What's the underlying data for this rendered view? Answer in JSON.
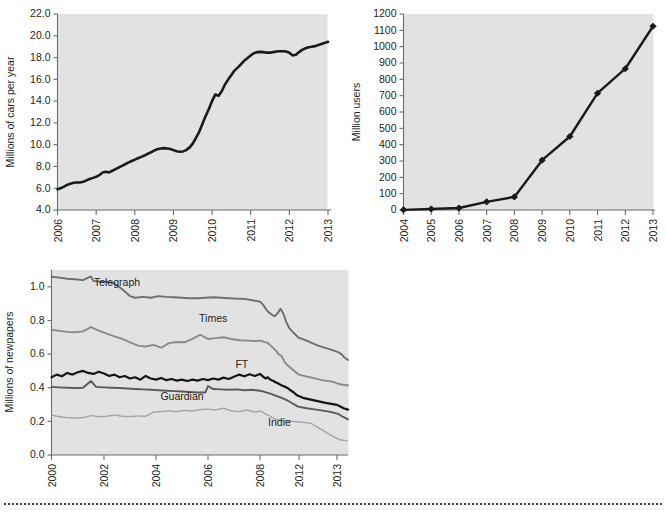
{
  "page": {
    "background_color": "#ffffff",
    "plot_background_color": "#e2e2e2",
    "axis_color": "#6b6b6b",
    "text_color": "#231f20",
    "footer_rule": "dotted-separator"
  },
  "chart_data": [
    {
      "id": "cars-chart",
      "type": "line",
      "title": "",
      "xlabel": "",
      "ylabel": "Millions of cars per year",
      "xlim": [
        2006,
        2013
      ],
      "ylim": [
        4.0,
        22.0
      ],
      "grid": false,
      "legend": "none",
      "ytick_labels": [
        "4.0",
        "6.0",
        "8.0",
        "10.0",
        "12.0",
        "14.0",
        "16.0",
        "18.0",
        "20.0",
        "22.0"
      ],
      "ytick_values": [
        4.0,
        6.0,
        8.0,
        10.0,
        12.0,
        14.0,
        16.0,
        18.0,
        20.0,
        22.0
      ],
      "xtick_labels": [
        "2006",
        "2007",
        "2008",
        "2009",
        "2010",
        "2011",
        "2012",
        "2013"
      ],
      "xtick_values": [
        2006,
        2007,
        2008,
        2009,
        2010,
        2011,
        2012,
        2013
      ],
      "line_color": "#1a1a1a",
      "series": [
        {
          "name": "Millions of cars per year",
          "x": [
            2006.0,
            2006.08,
            2006.17,
            2006.25,
            2006.33,
            2006.42,
            2006.5,
            2006.58,
            2006.67,
            2006.75,
            2006.83,
            2006.92,
            2007.0,
            2007.08,
            2007.17,
            2007.25,
            2007.33,
            2007.42,
            2007.5,
            2007.58,
            2007.67,
            2007.75,
            2007.83,
            2007.92,
            2008.0,
            2008.08,
            2008.17,
            2008.25,
            2008.33,
            2008.42,
            2008.5,
            2008.58,
            2008.67,
            2008.75,
            2008.83,
            2008.92,
            2009.0,
            2009.08,
            2009.17,
            2009.25,
            2009.33,
            2009.42,
            2009.5,
            2009.58,
            2009.67,
            2009.75,
            2009.83,
            2009.92,
            2010.0,
            2010.08,
            2010.17,
            2010.25,
            2010.33,
            2010.42,
            2010.5,
            2010.58,
            2010.67,
            2010.75,
            2010.83,
            2010.92,
            2011.0,
            2011.08,
            2011.17,
            2011.25,
            2011.33,
            2011.42,
            2011.5,
            2011.58,
            2011.67,
            2011.75,
            2011.83,
            2011.92,
            2012.0,
            2012.08,
            2012.17,
            2012.25,
            2012.33,
            2012.42,
            2012.5,
            2012.58,
            2012.67,
            2012.75,
            2012.83,
            2012.92,
            2013.0
          ],
          "y": [
            5.9,
            6.0,
            6.15,
            6.3,
            6.42,
            6.5,
            6.52,
            6.53,
            6.6,
            6.72,
            6.85,
            6.95,
            7.05,
            7.2,
            7.45,
            7.52,
            7.45,
            7.6,
            7.75,
            7.9,
            8.05,
            8.2,
            8.35,
            8.5,
            8.62,
            8.75,
            8.88,
            9.0,
            9.15,
            9.3,
            9.45,
            9.58,
            9.65,
            9.68,
            9.65,
            9.6,
            9.5,
            9.4,
            9.35,
            9.38,
            9.5,
            9.75,
            10.1,
            10.6,
            11.2,
            11.9,
            12.6,
            13.3,
            14.0,
            14.6,
            14.5,
            14.9,
            15.5,
            16.0,
            16.4,
            16.8,
            17.1,
            17.4,
            17.7,
            17.95,
            18.2,
            18.4,
            18.5,
            18.52,
            18.5,
            18.45,
            18.45,
            18.5,
            18.55,
            18.58,
            18.58,
            18.55,
            18.45,
            18.2,
            18.25,
            18.5,
            18.7,
            18.85,
            18.95,
            19.0,
            19.05,
            19.15,
            19.25,
            19.35,
            19.45
          ]
        }
      ]
    },
    {
      "id": "users-chart",
      "type": "line",
      "title": "",
      "xlabel": "",
      "ylabel": "Million users",
      "xlim": [
        2004,
        2013
      ],
      "ylim": [
        0,
        1200
      ],
      "grid": false,
      "legend": "none",
      "markers": "diamond",
      "ytick_labels": [
        "0",
        "100",
        "200",
        "300",
        "400",
        "500",
        "600",
        "700",
        "800",
        "900",
        "1000",
        "1100",
        "1200"
      ],
      "ytick_values": [
        0,
        100,
        200,
        300,
        400,
        500,
        600,
        700,
        800,
        900,
        1000,
        1100,
        1200
      ],
      "xtick_labels": [
        "2004",
        "2005",
        "2006",
        "2007",
        "2008",
        "2009",
        "2010",
        "2011",
        "2012",
        "2013"
      ],
      "xtick_values": [
        2004,
        2005,
        2006,
        2007,
        2008,
        2009,
        2010,
        2011,
        2012,
        2013
      ],
      "line_color": "#1a1a1a",
      "series": [
        {
          "name": "Million users",
          "x": [
            2004,
            2005,
            2006,
            2007,
            2008,
            2009,
            2010,
            2011,
            2012,
            2013
          ],
          "y": [
            1,
            6,
            12,
            50,
            80,
            305,
            450,
            715,
            865,
            1125
          ]
        }
      ]
    },
    {
      "id": "newspapers-chart",
      "type": "line",
      "title": "",
      "xlabel": "",
      "ylabel": "Millions of newpapers",
      "xlim": [
        2000,
        2014
      ],
      "ylim": [
        0.0,
        1.1
      ],
      "grid": false,
      "legend": "inline-labels",
      "ytick_labels": [
        "0.0",
        "0.2",
        "0.4",
        "0.6",
        "0.8",
        "1.0"
      ],
      "ytick_values": [
        0.0,
        0.2,
        0.4,
        0.6,
        0.8,
        1.0
      ],
      "xtick_labels": [
        "2000",
        "2002",
        "2004",
        "2006",
        "2008",
        "2012",
        "2013"
      ],
      "xtick_values": [
        2000,
        2002,
        2004,
        2006,
        2008,
        2012,
        2013
      ],
      "series": [
        {
          "name": "Telegraph",
          "color": "#6e6e6e",
          "label_x": 2002.5,
          "label_y": 1.005,
          "x": [
            2000.0,
            2000.3,
            2000.6,
            2000.9,
            2001.2,
            2001.5,
            2001.6,
            2001.8,
            2002.1,
            2002.4,
            2002.7,
            2003.0,
            2003.2,
            2003.5,
            2003.8,
            2004.1,
            2004.4,
            2004.7,
            2005.0,
            2005.3,
            2005.6,
            2005.9,
            2006.2,
            2006.5,
            2006.8,
            2007.1,
            2007.4,
            2007.7,
            2008.0,
            2008.3,
            2008.6,
            2008.9,
            2009.2,
            2009.5,
            2009.8,
            2010.1,
            2010.4,
            2010.7,
            2011.0,
            2011.3,
            2011.6,
            2011.9,
            2012.2,
            2012.5,
            2012.8,
            2013.1,
            2013.4,
            2013.7,
            2014.0
          ],
          "y": [
            1.06,
            1.055,
            1.048,
            1.045,
            1.04,
            1.062,
            1.035,
            1.032,
            1.03,
            1.02,
            0.985,
            0.945,
            0.935,
            0.94,
            0.935,
            0.945,
            0.94,
            0.938,
            0.935,
            0.932,
            0.932,
            0.935,
            0.938,
            0.935,
            0.932,
            0.93,
            0.928,
            0.92,
            0.912,
            0.895,
            0.868,
            0.848,
            0.835,
            0.825,
            0.842,
            0.87,
            0.84,
            0.79,
            0.755,
            0.735,
            0.718,
            0.7,
            0.68,
            0.65,
            0.63,
            0.612,
            0.6,
            0.578,
            0.565
          ]
        },
        {
          "name": "Times",
          "color": "#8a8a8a",
          "label_x": 2006.2,
          "label_y": 0.79,
          "x": [
            2000.0,
            2000.3,
            2000.6,
            2000.9,
            2001.2,
            2001.5,
            2001.8,
            2002.1,
            2002.4,
            2002.7,
            2003.0,
            2003.3,
            2003.6,
            2003.9,
            2004.2,
            2004.5,
            2004.8,
            2005.1,
            2005.4,
            2005.7,
            2006.0,
            2006.3,
            2006.6,
            2006.9,
            2007.2,
            2007.5,
            2007.8,
            2008.1,
            2008.4,
            2008.7,
            2009.0,
            2009.3,
            2009.6,
            2009.9,
            2010.2,
            2010.5,
            2010.8,
            2011.1,
            2011.4,
            2011.7,
            2012.0,
            2012.3,
            2012.6,
            2012.9,
            2013.2,
            2013.5,
            2013.8,
            2014.0
          ],
          "y": [
            0.745,
            0.738,
            0.732,
            0.73,
            0.735,
            0.76,
            0.74,
            0.722,
            0.705,
            0.69,
            0.67,
            0.65,
            0.645,
            0.655,
            0.638,
            0.665,
            0.672,
            0.67,
            0.69,
            0.715,
            0.69,
            0.695,
            0.7,
            0.69,
            0.682,
            0.68,
            0.678,
            0.68,
            0.672,
            0.67,
            0.655,
            0.64,
            0.622,
            0.6,
            0.59,
            0.555,
            0.535,
            0.52,
            0.505,
            0.49,
            0.478,
            0.462,
            0.445,
            0.435,
            0.422,
            0.418,
            0.415,
            0.415
          ]
        },
        {
          "name": "FT",
          "color": "#151515",
          "label_x": 2007.3,
          "label_y": 0.52,
          "x": [
            2000.0,
            2000.2,
            2000.4,
            2000.6,
            2000.8,
            2001.0,
            2001.2,
            2001.4,
            2001.6,
            2001.8,
            2002.0,
            2002.2,
            2002.4,
            2002.6,
            2002.8,
            2003.0,
            2003.2,
            2003.4,
            2003.6,
            2003.8,
            2004.0,
            2004.2,
            2004.4,
            2004.6,
            2004.8,
            2005.0,
            2005.2,
            2005.4,
            2005.6,
            2005.8,
            2006.0,
            2006.2,
            2006.4,
            2006.6,
            2006.8,
            2007.0,
            2007.2,
            2007.4,
            2007.6,
            2007.8,
            2008.0,
            2008.2,
            2008.4,
            2008.6,
            2008.8,
            2009.0,
            2009.2,
            2009.4,
            2009.6,
            2009.8,
            2010.0,
            2010.3,
            2010.6,
            2010.9,
            2011.2,
            2011.5,
            2011.8,
            2012.1,
            2012.4,
            2012.7,
            2013.0,
            2013.3,
            2013.6,
            2014.0
          ],
          "y": [
            0.462,
            0.478,
            0.468,
            0.488,
            0.478,
            0.492,
            0.5,
            0.488,
            0.482,
            0.495,
            0.485,
            0.47,
            0.478,
            0.462,
            0.47,
            0.455,
            0.462,
            0.448,
            0.47,
            0.455,
            0.448,
            0.458,
            0.445,
            0.452,
            0.442,
            0.448,
            0.44,
            0.448,
            0.442,
            0.452,
            0.445,
            0.455,
            0.448,
            0.46,
            0.452,
            0.465,
            0.478,
            0.468,
            0.48,
            0.47,
            0.482,
            0.472,
            0.462,
            0.455,
            0.462,
            0.45,
            0.445,
            0.44,
            0.432,
            0.428,
            0.42,
            0.412,
            0.405,
            0.395,
            0.382,
            0.37,
            0.355,
            0.34,
            0.325,
            0.31,
            0.298,
            0.288,
            0.278,
            0.27
          ]
        },
        {
          "name": "Guardian",
          "color": "#5a5a5a",
          "label_x": 2005.0,
          "label_y": 0.33,
          "x": [
            2000.0,
            2000.3,
            2000.6,
            2000.9,
            2001.2,
            2001.5,
            2001.7,
            2002.0,
            2002.3,
            2002.6,
            2002.9,
            2003.2,
            2003.5,
            2003.8,
            2004.1,
            2004.4,
            2004.7,
            2005.0,
            2005.3,
            2005.6,
            2005.9,
            2006.0,
            2006.2,
            2006.5,
            2006.8,
            2007.1,
            2007.4,
            2007.7,
            2008.0,
            2008.3,
            2008.6,
            2008.9,
            2009.2,
            2009.5,
            2009.8,
            2010.1,
            2010.4,
            2010.7,
            2011.0,
            2011.3,
            2011.6,
            2011.9,
            2012.2,
            2012.5,
            2012.8,
            2013.1,
            2013.4,
            2013.7,
            2014.0
          ],
          "y": [
            0.405,
            0.402,
            0.4,
            0.398,
            0.4,
            0.44,
            0.405,
            0.402,
            0.4,
            0.398,
            0.395,
            0.392,
            0.39,
            0.388,
            0.385,
            0.382,
            0.38,
            0.378,
            0.375,
            0.372,
            0.372,
            0.41,
            0.392,
            0.39,
            0.388,
            0.39,
            0.385,
            0.388,
            0.382,
            0.378,
            0.372,
            0.368,
            0.362,
            0.355,
            0.348,
            0.342,
            0.335,
            0.328,
            0.318,
            0.308,
            0.298,
            0.288,
            0.278,
            0.268,
            0.258,
            0.245,
            0.232,
            0.222,
            0.212
          ]
        },
        {
          "name": "Indie",
          "color": "#9e9e9e",
          "style": "dotted",
          "label_x": 2010.0,
          "label_y": 0.175,
          "x": [
            2000.0,
            2000.3,
            2000.6,
            2000.9,
            2001.2,
            2001.5,
            2001.8,
            2002.1,
            2002.4,
            2002.7,
            2003.0,
            2003.3,
            2003.6,
            2003.9,
            2004.2,
            2004.5,
            2004.8,
            2005.1,
            2005.4,
            2005.7,
            2006.0,
            2006.3,
            2006.6,
            2006.9,
            2007.2,
            2007.5,
            2007.8,
            2008.1,
            2008.4,
            2008.7,
            2009.0,
            2009.3,
            2009.6,
            2009.9,
            2010.2,
            2010.5,
            2010.8,
            2011.1,
            2011.4,
            2011.7,
            2012.0,
            2012.3,
            2012.6,
            2012.9,
            2013.2,
            2013.5,
            2013.8,
            2014.0
          ],
          "y": [
            0.238,
            0.228,
            0.222,
            0.22,
            0.222,
            0.235,
            0.228,
            0.23,
            0.238,
            0.23,
            0.228,
            0.232,
            0.23,
            0.255,
            0.258,
            0.262,
            0.258,
            0.265,
            0.262,
            0.27,
            0.272,
            0.268,
            0.278,
            0.262,
            0.258,
            0.268,
            0.255,
            0.262,
            0.25,
            0.24,
            0.232,
            0.222,
            0.212,
            0.21,
            0.208,
            0.205,
            0.205,
            0.203,
            0.2,
            0.198,
            0.196,
            0.19,
            0.15,
            0.11,
            0.092,
            0.088,
            0.086,
            0.085
          ]
        }
      ]
    }
  ]
}
